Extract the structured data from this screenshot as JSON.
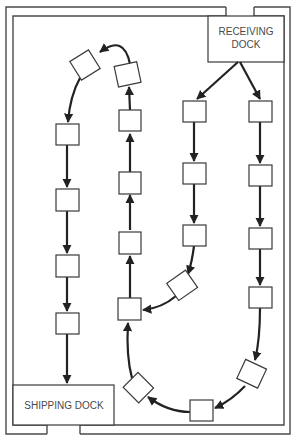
{
  "diagram": {
    "receiving_dock": {
      "line1": "RECEIVING",
      "line2": "DOCK"
    },
    "shipping_dock": {
      "label": "SHIPPING DOCK"
    },
    "stations_count": 20,
    "flow": "Receiving dock splits into two parallel lanes flowing down; they rejoin at bottom and loop up the middle lane, over the top, and down the left lane to the shipping dock"
  }
}
